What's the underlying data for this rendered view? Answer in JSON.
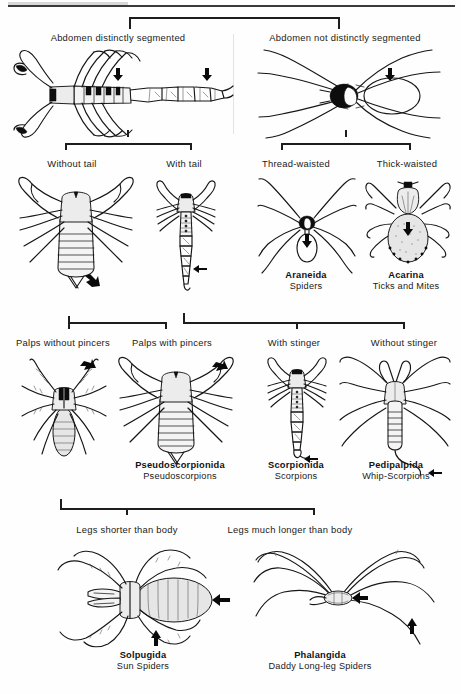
{
  "document": {
    "type": "dichotomous-identification-key",
    "subject": "Orders of Arachnida",
    "top_rule": true
  },
  "tiers": [
    {
      "id": "tier-1",
      "bracket": {
        "x1": 129,
        "x2": 340,
        "y": 17,
        "stem": null,
        "ends": "down"
      },
      "labels": [
        {
          "id": "abdomen-segmented",
          "text": "Abdomen distinctly segmented",
          "x": 118,
          "y": 30
        },
        {
          "id": "abdomen-not-segmented",
          "text": "Abdomen not distinctly segmented",
          "x": 345,
          "y": 30
        }
      ],
      "figures": [
        {
          "id": "scorpion-lateral",
          "caption": null
        },
        {
          "id": "spider-dorsal",
          "caption": null
        }
      ]
    },
    {
      "id": "tier-2",
      "brackets": [
        {
          "id": "bracket-left",
          "x1": 65,
          "x2": 192,
          "y": 143,
          "stem_x": 128,
          "ends": "down"
        },
        {
          "id": "bracket-right",
          "x1": 281,
          "x2": 411,
          "y": 143,
          "stem_x": 346,
          "ends": "down"
        }
      ],
      "labels": [
        {
          "id": "without-tail",
          "text": "Without tail",
          "x": 72,
          "y": 158
        },
        {
          "id": "with-tail",
          "text": "With tail",
          "x": 184,
          "y": 158
        },
        {
          "id": "thread-waisted",
          "text": "Thread-waisted",
          "x": 296,
          "y": 158
        },
        {
          "id": "thick-waisted",
          "text": "Thick-waisted",
          "x": 407,
          "y": 158
        }
      ],
      "taxa": [
        {
          "id": "araneida",
          "scientific": "Araneida",
          "common": "Spiders",
          "x": 306,
          "y": 277
        },
        {
          "id": "acarina",
          "scientific": "Acarina",
          "common": "Ticks and Mites",
          "x": 406,
          "y": 277
        }
      ]
    },
    {
      "id": "tier-3",
      "brackets": [
        {
          "id": "bracket-left",
          "x1": 68,
          "x2": 167,
          "y": 322,
          "stem_x": null,
          "ends": "down"
        },
        {
          "id": "bracket-right",
          "x1": 183,
          "x2": 405,
          "y": 322,
          "stem_x": 296,
          "ends": "down",
          "left_end": "up"
        }
      ],
      "labels": [
        {
          "id": "palps-without-pincers",
          "text": "Palps without pincers",
          "x": 63,
          "y": 337
        },
        {
          "id": "palps-with-pincers",
          "text": "Palps with pincers",
          "x": 172,
          "y": 337
        },
        {
          "id": "with-stinger",
          "text": "With stinger",
          "x": 294,
          "y": 337
        },
        {
          "id": "without-stinger",
          "text": "Without stinger",
          "x": 404,
          "y": 337
        }
      ],
      "taxa": [
        {
          "id": "pseudoscorpionida",
          "scientific": "Pseudoscorpionida",
          "common": "Pseudoscorpions",
          "x": 180,
          "y": 467
        },
        {
          "id": "scorpionida",
          "scientific": "Scorpionida",
          "common": "Scorpions",
          "x": 296,
          "y": 467
        },
        {
          "id": "pedipalpida",
          "scientific": "Pedipalpida",
          "common": "Whip-Scorpions",
          "x": 396,
          "y": 467
        }
      ]
    },
    {
      "id": "tier-4",
      "bracket": {
        "x1": 60,
        "x2": 315,
        "y": 508,
        "stem_x": 126,
        "ends": "down",
        "left_end": "up"
      },
      "labels": [
        {
          "id": "legs-shorter-than-body",
          "text": "Legs shorter than body",
          "x": 127,
          "y": 524
        },
        {
          "id": "legs-much-longer-than-body",
          "text": "Legs much longer than body",
          "x": 290,
          "y": 524
        }
      ],
      "taxa": [
        {
          "id": "solpugida",
          "scientific": "Solpugida",
          "common": "Sun Spiders",
          "x": 143,
          "y": 657
        },
        {
          "id": "phalangida",
          "scientific": "Phalangida",
          "common": "Daddy Long-leg Spiders",
          "x": 320,
          "y": 657
        }
      ]
    }
  ],
  "colors": {
    "ink": "#161616",
    "rule": "#3a3a3a",
    "background": "#fefefe",
    "divider": "#e3e3e3"
  },
  "annotations": {
    "arrow_marker": "down-arrow",
    "arrow_count": 12,
    "note": "Small solid arrows point to the diagnostic character on each figure."
  }
}
